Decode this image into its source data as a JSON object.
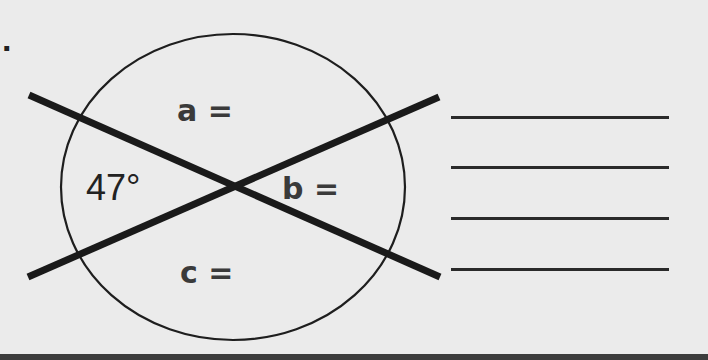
{
  "problem": {
    "number_marker": ".",
    "given_angle": "47°",
    "unknowns": [
      {
        "name": "a",
        "label": "a ="
      },
      {
        "name": "b",
        "label": "b ="
      },
      {
        "name": "c",
        "label": "c ="
      }
    ],
    "answer_blank_count": 4
  },
  "figure": {
    "shape": "circle",
    "intersecting_lines": 2,
    "stroke_color": "#1e1e1e",
    "background_color": "#ebebeb"
  }
}
